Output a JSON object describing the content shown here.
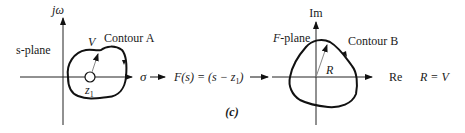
{
  "left_plane": {
    "name": "s-plane",
    "vertical_axis": "jω",
    "horizontal_axis": "σ",
    "contour": "Contour A",
    "vector": "V",
    "point": "z",
    "point_sub": "1"
  },
  "mapping": {
    "function_text": "F(s) = (s − z",
    "function_sub": "1",
    "function_close": ")"
  },
  "right_plane": {
    "name": "F-plane",
    "vertical_axis": "Im",
    "horizontal_axis": "Re",
    "contour": "Contour B",
    "vector": "R",
    "relation": "R = V"
  },
  "caption": "(c)"
}
